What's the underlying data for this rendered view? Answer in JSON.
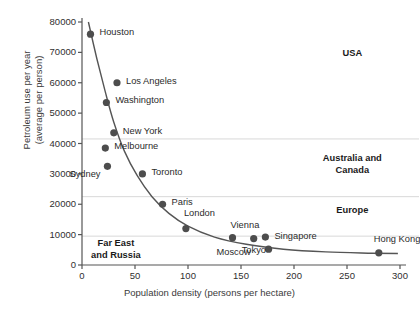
{
  "chart_data": {
    "type": "scatter",
    "title": "",
    "xlabel": "Population density (persons per hectare)",
    "ylabel": "Petroleum use per year\n(average per person)",
    "xlim": [
      0,
      300
    ],
    "ylim": [
      0,
      80000
    ],
    "xticks": [
      0,
      50,
      100,
      150,
      200,
      250,
      300
    ],
    "yticks": [
      0,
      10000,
      20000,
      30000,
      40000,
      50000,
      60000,
      70000,
      80000
    ],
    "grid": "horizontal-partial",
    "legend": "none",
    "marker_color": "#4d4d4d",
    "curve_color": "#555555",
    "gridline_color": "#d8d8d8",
    "axis_color": "#555555",
    "points": [
      {
        "label": "Houston",
        "x": 8,
        "y": 76000,
        "label_dx": 9,
        "label_dy": -4
      },
      {
        "label": "Los Angeles",
        "x": 33,
        "y": 60000,
        "label_dx": 9,
        "label_dy": -4
      },
      {
        "label": "Washington",
        "x": 23,
        "y": 53500,
        "label_dx": 9,
        "label_dy": -4
      },
      {
        "label": "New York",
        "x": 30,
        "y": 43500,
        "label_dx": 9,
        "label_dy": -4
      },
      {
        "label": "Melbourne",
        "x": 22,
        "y": 38500,
        "label_dx": 9,
        "label_dy": -4
      },
      {
        "label": "Sydney",
        "x": 24,
        "y": 32500,
        "label_dx": -38,
        "label_dy": 6
      },
      {
        "label": "Toronto",
        "x": 57,
        "y": 30000,
        "label_dx": 9,
        "label_dy": -4
      },
      {
        "label": "Paris",
        "x": 76,
        "y": 20000,
        "label_dx": 9,
        "label_dy": -4
      },
      {
        "label": "London",
        "x": 98,
        "y": 12000,
        "label_dx": -2,
        "label_dy": -18
      },
      {
        "label": "Vienna",
        "x": 142,
        "y": 9000,
        "label_dx": -2,
        "label_dy": -15
      },
      {
        "label": "Tokyo",
        "x": 162,
        "y": 8700,
        "label_dx": -12,
        "label_dy": 9
      },
      {
        "label": "Singapore",
        "x": 173,
        "y": 9200,
        "label_dx": 9,
        "label_dy": -3
      },
      {
        "label": "Moscow",
        "x": 176,
        "y": 5200,
        "label_dx": -52,
        "label_dy": 1
      },
      {
        "label": "Hong Kong",
        "x": 280,
        "y": 4000,
        "label_dx": -5,
        "label_dy": -16
      }
    ],
    "trend_curve": {
      "description": "smooth decaying fitted curve from top-left to bottom-right",
      "path_points": [
        {
          "x": 6,
          "y": 80000
        },
        {
          "x": 14,
          "y": 68000
        },
        {
          "x": 22,
          "y": 57000
        },
        {
          "x": 30,
          "y": 47000
        },
        {
          "x": 40,
          "y": 37500
        },
        {
          "x": 52,
          "y": 29500
        },
        {
          "x": 66,
          "y": 22500
        },
        {
          "x": 82,
          "y": 17000
        },
        {
          "x": 100,
          "y": 12800
        },
        {
          "x": 125,
          "y": 9200
        },
        {
          "x": 155,
          "y": 6800
        },
        {
          "x": 190,
          "y": 5200
        },
        {
          "x": 230,
          "y": 4300
        },
        {
          "x": 270,
          "y": 3900
        },
        {
          "x": 298,
          "y": 3800
        }
      ]
    },
    "region_labels": [
      {
        "text": "USA",
        "x": 255,
        "y": 69000
      },
      {
        "text": "Australia and\nCanada",
        "x": 255,
        "y": 34500
      },
      {
        "text": "Europe",
        "x": 255,
        "y": 17500
      },
      {
        "text": "Far East\nand Russia",
        "x": 32,
        "y": 6500
      }
    ],
    "separator_lines": [
      {
        "y": 41500,
        "x_from": 0,
        "x_to": 300
      },
      {
        "y": 22500,
        "x_from": 0,
        "x_to": 300
      },
      {
        "y": 9500,
        "x_from": 0,
        "x_to": 300
      }
    ]
  }
}
